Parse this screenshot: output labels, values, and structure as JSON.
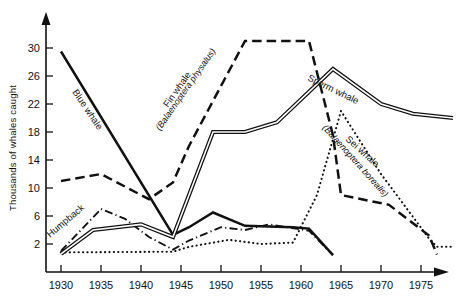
{
  "chart_data": {
    "type": "line",
    "title": "",
    "xlabel": "",
    "ylabel": "Thousands of whales caught",
    "xlim": [
      1929,
      1980
    ],
    "ylim": [
      0,
      32
    ],
    "xticks": [
      1930,
      1935,
      1940,
      1945,
      1950,
      1955,
      1960,
      1965,
      1970,
      1975
    ],
    "yticks": [
      2,
      6,
      10,
      14,
      18,
      22,
      26,
      30
    ],
    "grid": false,
    "legend": "inline-labels",
    "series": [
      {
        "name": "Blue whale",
        "label": "Blue whale",
        "sublabel": "",
        "style": "solid",
        "x": [
          1930,
          1944,
          1946,
          1949,
          1953,
          1959,
          1961,
          1964
        ],
        "y": [
          29.5,
          3.3,
          4.4,
          6.5,
          4.6,
          4.4,
          4.2,
          0.4
        ]
      },
      {
        "name": "Fin whale",
        "label": "Fin whale",
        "sublabel": "(Balaenoptera physalus)",
        "style": "dashed",
        "x": [
          1930,
          1935,
          1941,
          1944,
          1946,
          1953,
          1961,
          1964,
          1965,
          1971,
          1976,
          1977
        ],
        "y": [
          11.0,
          12.0,
          8.4,
          10.8,
          16.0,
          31.0,
          31.0,
          17.5,
          9.0,
          7.6,
          3.2,
          0.5
        ]
      },
      {
        "name": "Sperm whale",
        "label": "Sperm whale",
        "sublabel": "",
        "style": "double",
        "x": [
          1930,
          1934,
          1940,
          1944,
          1949,
          1953,
          1957,
          1964,
          1970,
          1974,
          1979
        ],
        "y": [
          0.6,
          4.0,
          4.8,
          3.0,
          18.0,
          18.0,
          19.4,
          27.0,
          22.0,
          20.6,
          20.0
        ]
      },
      {
        "name": "Sei whale",
        "label": "Sei whale",
        "sublabel": "(Balaenoptera borealis)",
        "style": "dotted",
        "x": [
          1930,
          1944,
          1946,
          1951,
          1955,
          1959,
          1962,
          1965,
          1970,
          1976,
          1977,
          1979
        ],
        "y": [
          0.8,
          0.9,
          1.6,
          2.6,
          2.0,
          2.2,
          9.0,
          21.0,
          12.0,
          2.8,
          1.6,
          1.6
        ]
      },
      {
        "name": "Humpback whale",
        "label": "Humpback",
        "sublabel": "",
        "style": "dash-dot",
        "x": [
          1930,
          1935,
          1938,
          1941,
          1944,
          1946,
          1950,
          1953,
          1956,
          1961,
          1964
        ],
        "y": [
          1.0,
          7.0,
          5.6,
          3.0,
          1.2,
          2.5,
          4.4,
          4.0,
          4.8,
          3.9,
          0.4
        ]
      }
    ]
  },
  "axis": {
    "y_title": "Thousands of whales caught",
    "x_tick_labels": [
      "1930",
      "1935",
      "1940",
      "1945",
      "1950",
      "1955",
      "1960",
      "1965",
      "1970",
      "1975"
    ],
    "y_tick_labels": [
      "2",
      "6",
      "10",
      "14",
      "18",
      "22",
      "26",
      "30"
    ]
  },
  "labels": {
    "blue_whale": "Blue whale",
    "fin_whale": "Fin whale",
    "fin_whale_latin": "(Balaenoptera physalus)",
    "sperm_whale": "Sperm whale",
    "sei_whale": "Sei whale",
    "sei_whale_latin": "(Balaenoptera borealis)",
    "humpback": "Humpback"
  },
  "colors": {
    "ink": "#111111",
    "background": "#ffffff"
  }
}
